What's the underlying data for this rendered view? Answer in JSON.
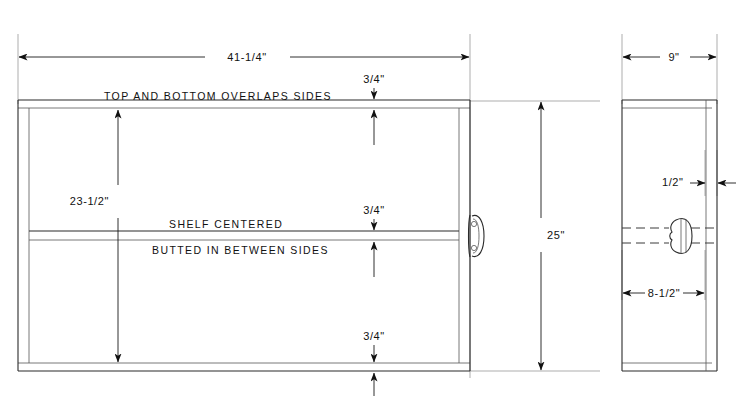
{
  "drawing": {
    "title": "Cabinet Construction Drawing",
    "views": {
      "front": {
        "name": "front-elevation"
      },
      "side": {
        "name": "side-elevation"
      }
    }
  },
  "dimensions": {
    "overall_width": "41-1/4\"",
    "overall_height": "25\"",
    "interior_height": "23-1/2\"",
    "top_thickness": "3/4\"",
    "shelf_thickness_upper": "3/4\"",
    "bottom_thickness": "3/4\"",
    "side_depth": "9\"",
    "back_panel_thickness": "1/2\"",
    "handle_offset": "8-1/2\""
  },
  "notes": {
    "top_note": "TOP  AND  BOTTOM  OVERLAPS SIDES",
    "shelf_note_line1": "SHELF   CENTERED",
    "shelf_note_line2": "BUTTED  IN BETWEEN SIDES"
  },
  "colors": {
    "object_line": "#2b2b2b",
    "extension_line": "#8a8a8a",
    "dimension_line": "#1a1a1a",
    "text": "#111111",
    "background": "#ffffff"
  }
}
